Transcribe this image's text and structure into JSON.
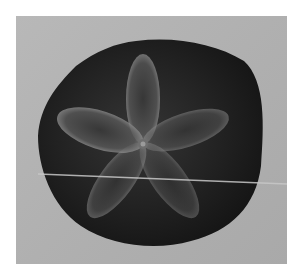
{
  "image": {
    "subject": "sand dollar",
    "description": "Grayscale photograph of a dark sand dollar with a five-petal pattern on a light gray background, crossed by a thin horizontal light line",
    "colors": {
      "border": "#ffffff",
      "background": "#b0b0b0",
      "subject_dark": "#1e1e1e",
      "petal_highlight": "#7a7a7a",
      "scratch_line": "#c8c8c8"
    }
  }
}
